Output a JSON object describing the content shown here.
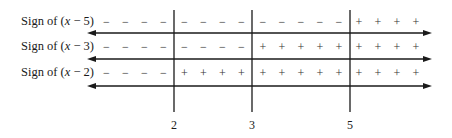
{
  "chart_data": {
    "type": "sign-chart",
    "title": "",
    "critical_points": [
      2,
      3,
      5
    ],
    "critical_point_labels": [
      "2",
      "3",
      "5"
    ],
    "rows": [
      {
        "label_prefix": "Sign of (",
        "label_var": "x",
        "label_suffix": " − 5)",
        "factor": "x - 5",
        "intervals": [
          {
            "range": "x < 2",
            "sign": "−",
            "count": 4
          },
          {
            "range": "2 < x < 3",
            "sign": "−",
            "count": 4
          },
          {
            "range": "3 < x < 5",
            "sign": "−",
            "count": 5
          },
          {
            "range": "x > 5",
            "sign": "+",
            "count": 4
          }
        ]
      },
      {
        "label_prefix": "Sign of (",
        "label_var": "x",
        "label_suffix": " − 3)",
        "factor": "x - 3",
        "intervals": [
          {
            "range": "x < 2",
            "sign": "−",
            "count": 4
          },
          {
            "range": "2 < x < 3",
            "sign": "−",
            "count": 4
          },
          {
            "range": "3 < x < 5",
            "sign": "+",
            "count": 5
          },
          {
            "range": "x > 5",
            "sign": "+",
            "count": 4
          }
        ]
      },
      {
        "label_prefix": "Sign of (",
        "label_var": "x",
        "label_suffix": " − 2)",
        "factor": "x - 2",
        "intervals": [
          {
            "range": "x < 2",
            "sign": "−",
            "count": 4
          },
          {
            "range": "2 < x < 3",
            "sign": "+",
            "count": 4
          },
          {
            "range": "3 < x < 5",
            "sign": "+",
            "count": 5
          },
          {
            "range": "x > 5",
            "sign": "+",
            "count": 4
          }
        ]
      }
    ],
    "number_line": {
      "arrows": "both-ends",
      "line_color": "#1a1a1a"
    }
  }
}
